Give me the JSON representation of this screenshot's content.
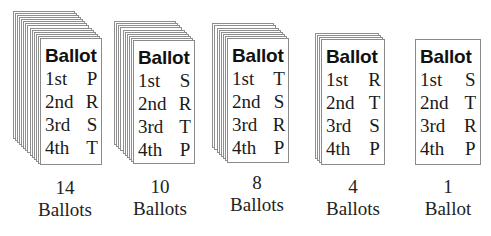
{
  "diagram": {
    "stacks": [
      {
        "title": "Ballot",
        "ranks": [
          {
            "rank": "1st",
            "candidate": "P"
          },
          {
            "rank": "2nd",
            "candidate": "R"
          },
          {
            "rank": "3rd",
            "candidate": "S"
          },
          {
            "rank": "4th",
            "candidate": "T"
          }
        ],
        "count": "14",
        "count_label": "Ballots"
      },
      {
        "title": "Ballot",
        "ranks": [
          {
            "rank": "1st",
            "candidate": "S"
          },
          {
            "rank": "2nd",
            "candidate": "R"
          },
          {
            "rank": "3rd",
            "candidate": "T"
          },
          {
            "rank": "4th",
            "candidate": "P"
          }
        ],
        "count": "10",
        "count_label": "Ballots"
      },
      {
        "title": "Ballot",
        "ranks": [
          {
            "rank": "1st",
            "candidate": "T"
          },
          {
            "rank": "2nd",
            "candidate": "S"
          },
          {
            "rank": "3rd",
            "candidate": "R"
          },
          {
            "rank": "4th",
            "candidate": "P"
          }
        ],
        "count": "8",
        "count_label": "Ballots"
      },
      {
        "title": "Ballot",
        "ranks": [
          {
            "rank": "1st",
            "candidate": "R"
          },
          {
            "rank": "2nd",
            "candidate": "T"
          },
          {
            "rank": "3rd",
            "candidate": "S"
          },
          {
            "rank": "4th",
            "candidate": "P"
          }
        ],
        "count": "4",
        "count_label": "Ballots"
      },
      {
        "title": "Ballot",
        "ranks": [
          {
            "rank": "1st",
            "candidate": "S"
          },
          {
            "rank": "2nd",
            "candidate": "T"
          },
          {
            "rank": "3rd",
            "candidate": "R"
          },
          {
            "rank": "4th",
            "candidate": "P"
          }
        ],
        "count": "1",
        "count_label": "Ballot"
      }
    ]
  }
}
